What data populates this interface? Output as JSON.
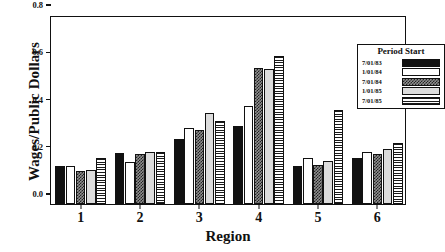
{
  "chart_data": {
    "type": "bar",
    "title": "",
    "subtitle": "",
    "xlabel": "Region",
    "ylabel": "Wages/Public Dollars",
    "categories": [
      "1",
      "2",
      "3",
      "4",
      "5",
      "6"
    ],
    "ylim": [
      0.0,
      0.8
    ],
    "yticks": [
      "0.0",
      "0.2",
      "0.4",
      "0.6",
      "0.8"
    ],
    "ytick_values": [
      0.0,
      0.2,
      0.4,
      0.6,
      0.8
    ],
    "grid": false,
    "legend_position": "top-right",
    "legend_title": "Period Start",
    "series": [
      {
        "name": "7/01/83",
        "pattern": "solid-black",
        "values": [
          0.16,
          0.215,
          0.274,
          0.33,
          0.16,
          0.195
        ]
      },
      {
        "name": "1/01/84",
        "pattern": "white",
        "values": [
          0.16,
          0.178,
          0.322,
          0.415,
          0.193,
          0.222
        ]
      },
      {
        "name": "7/01/84",
        "pattern": "checkered",
        "values": [
          0.14,
          0.21,
          0.312,
          0.575,
          0.167,
          0.212
        ]
      },
      {
        "name": "1/01/85",
        "pattern": "light-gray",
        "values": [
          0.145,
          0.222,
          0.385,
          0.573,
          0.184,
          0.233
        ]
      },
      {
        "name": "7/01/85",
        "pattern": "horizontal-stripe",
        "values": [
          0.193,
          0.222,
          0.352,
          0.627,
          0.4,
          0.26
        ]
      }
    ]
  }
}
